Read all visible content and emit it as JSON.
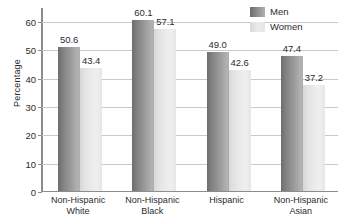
{
  "chart_data": {
    "type": "bar",
    "title": "",
    "xlabel": "",
    "ylabel": "Percentage",
    "ylim": [
      0,
      65
    ],
    "yticks": [
      0,
      10,
      20,
      30,
      40,
      50,
      60
    ],
    "ytick_labels": [
      "0",
      "10",
      "20",
      "30",
      "40",
      "50",
      "60"
    ],
    "grid": "horizontal",
    "legend_position": "top-right",
    "categories": [
      "Non-Hispanic White",
      "Non-Hispanic Black",
      "Hispanic",
      "Non-Hispanic Asian"
    ],
    "category_lines": [
      [
        "Non-Hispanic",
        "White"
      ],
      [
        "Non-Hispanic",
        "Black"
      ],
      [
        "Hispanic",
        ""
      ],
      [
        "Non-Hispanic",
        "Asian"
      ]
    ],
    "series": [
      {
        "name": "Men",
        "color": "#8f8f8f",
        "values": [
          50.6,
          60.1,
          49.0,
          47.4
        ],
        "labels": [
          "50.6",
          "60.1",
          "49.0",
          "47.4"
        ]
      },
      {
        "name": "Women",
        "color": "#e8e8e8",
        "values": [
          43.4,
          57.1,
          42.6,
          37.2
        ],
        "labels": [
          "43.4",
          "57.1",
          "42.6",
          "37.2"
        ]
      }
    ]
  },
  "legend": {
    "items": [
      {
        "label": "Men"
      },
      {
        "label": "Women"
      }
    ]
  },
  "colors": {
    "axis": "#8c8c8c",
    "gridline": "#c9c9c9",
    "text": "#2b2b2b",
    "background": "#ffffff"
  }
}
